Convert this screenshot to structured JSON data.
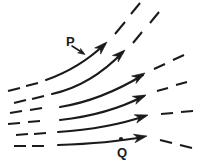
{
  "figure": {
    "type": "vector-field-streamlines",
    "title": "",
    "width": 219,
    "height": 165,
    "background_color": "#ffffff",
    "stroke_color": "#1a1a1a",
    "labels": [
      {
        "id": "P",
        "text": "P",
        "x": 66,
        "y": 35,
        "marker": "pointer-arrow",
        "points_to": {
          "x": 84,
          "y": 54
        }
      },
      {
        "id": "Q",
        "text": "Q",
        "x": 117,
        "y": 146,
        "marker": "dot",
        "points_to": {
          "x": 121,
          "y": 138
        }
      }
    ],
    "streamlines": [
      {
        "name": "streamline-1",
        "solid_path": "M 46,80 C 66,73 86,62 105,44",
        "arrow_tip": {
          "x": 107,
          "y": 42
        },
        "arrow_angle_deg": -44,
        "stroke_width": 2.1,
        "dashes_left": [
          "M 8,91 L 20,88",
          "M 26,86 L 38,83"
        ],
        "dashes_right": [
          "M 115,34 L 125,22",
          "M 131,14 L 140,3"
        ]
      },
      {
        "name": "streamline-2",
        "solid_path": "M 52,94 C 75,89 98,78 123,52",
        "arrow_tip": {
          "x": 125,
          "y": 50
        },
        "arrow_angle_deg": -42,
        "stroke_width": 2.1,
        "dashes_left": [
          "M 14,103 L 26,100",
          "M 32,99 L 44,96"
        ],
        "dashes_right": [
          "M 133,43 L 142,32",
          "M 150,23 L 159,12"
        ]
      },
      {
        "name": "streamline-3",
        "solid_path": "M 60,107 C 85,103 110,95 143,75",
        "arrow_tip": {
          "x": 145,
          "y": 73
        },
        "arrow_angle_deg": -31,
        "stroke_width": 2.1,
        "dashes_left": [
          "M 10,113 L 22,111",
          "M 30,110 L 42,108"
        ],
        "dashes_right": [
          "M 154,69 L 165,64",
          "M 173,60 L 184,55"
        ]
      },
      {
        "name": "streamline-4",
        "solid_path": "M 60,120 C 88,117 115,111 144,96",
        "arrow_tip": {
          "x": 146,
          "y": 95
        },
        "arrow_angle_deg": -24,
        "stroke_width": 2.1,
        "dashes_left": [
          "M 8,124 L 20,123",
          "M 28,122 L 40,121"
        ],
        "dashes_right": [
          "M 157,91 L 168,88",
          "M 176,85 L 187,82"
        ]
      },
      {
        "name": "streamline-5",
        "solid_path": "M 58,132 C 88,130 116,126 145,116",
        "arrow_tip": {
          "x": 148,
          "y": 115
        },
        "arrow_angle_deg": -17,
        "stroke_width": 2.1,
        "dashes_left": [
          "M 16,135 L 28,134",
          "M 34,134 L 46,133"
        ],
        "dashes_right": [
          "M 161,114 L 173,113",
          "M 181,112 L 193,111"
        ]
      },
      {
        "name": "streamline-6",
        "solid_path": "M 58,145 C 88,144 116,142 143,137",
        "arrow_tip": {
          "x": 147,
          "y": 136
        },
        "arrow_angle_deg": -11,
        "stroke_width": 2.1,
        "dashes_left": [
          "M 14,146 L 26,146",
          "M 32,146 L 44,146"
        ],
        "dashes_right": [
          "M 160,140 L 172,143",
          "M 180,145 L 192,148"
        ]
      }
    ],
    "dash_stroke_width": 2.0
  }
}
